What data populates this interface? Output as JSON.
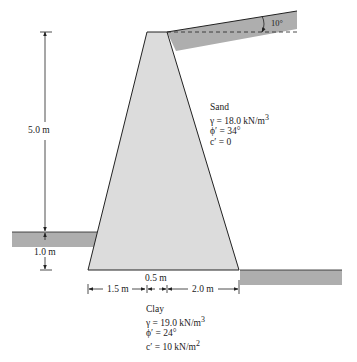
{
  "diagram": {
    "type": "retaining-wall-cross-section",
    "colors": {
      "wall_fill": "#dcdcdc",
      "soil_fill": "#aeaeae",
      "line": "#222222"
    },
    "dimensions": {
      "wall_height": "5.0 m",
      "embedment_depth": "1.0 m",
      "toe_width": "1.5 m",
      "top_width": "0.5 m",
      "heel_width": "2.0 m",
      "backfill_slope_angle": "10°"
    },
    "backfill": {
      "title": "Sand",
      "gamma": "γ = 18.0 kN/m",
      "gamma_exp": "3",
      "phi": "ϕ′ = 34°",
      "c": "c′ = 0"
    },
    "foundation": {
      "title": "Clay",
      "gamma": "γ = 19.0 kN/m",
      "gamma_exp": "3",
      "phi": "ϕ′ = 24°",
      "c": "c′ = 10 kN/m",
      "c_exp": "2"
    }
  }
}
